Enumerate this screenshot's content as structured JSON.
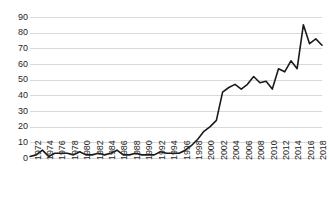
{
  "chart_data": {
    "type": "line",
    "title": "",
    "subtitle": "",
    "xlabel": "",
    "ylabel": "",
    "ylim": [
      0,
      90
    ],
    "ytick_step": 10,
    "yticks": [
      0,
      10,
      20,
      30,
      40,
      50,
      60,
      70,
      80,
      90
    ],
    "grid": "horizontal",
    "legend": "none",
    "line_color": "#1a1a1a",
    "gridline_color": "#d9d9d9",
    "tick_label_color": "#262626",
    "xtick_labels": [
      "1972",
      "1974",
      "1976",
      "1978",
      "1980",
      "1982",
      "1984",
      "1986",
      "1988",
      "1990",
      "1992",
      "1994",
      "1996",
      "1998",
      "2000",
      "2002",
      "2004",
      "2006",
      "2008",
      "2010",
      "2012",
      "2014",
      "2016",
      "2018"
    ],
    "xlim": [
      1972,
      2019
    ],
    "x": [
      1972,
      1973,
      1974,
      1975,
      1976,
      1977,
      1978,
      1979,
      1980,
      1981,
      1982,
      1983,
      1984,
      1985,
      1986,
      1987,
      1988,
      1989,
      1990,
      1991,
      1992,
      1993,
      1994,
      1995,
      1996,
      1997,
      1998,
      1999,
      2000,
      2001,
      2002,
      2003,
      2004,
      2005,
      2006,
      2007,
      2008,
      2009,
      2010,
      2011,
      2012,
      2013,
      2014,
      2015,
      2016,
      2017,
      2018,
      2019
    ],
    "series": [
      {
        "name": "value",
        "values": [
          1,
          2,
          5,
          1,
          3,
          3,
          3,
          2,
          4,
          2,
          2,
          3,
          2,
          3,
          5,
          2,
          2,
          3,
          2,
          2,
          2,
          4,
          3,
          3,
          3,
          5,
          8,
          12,
          17,
          20,
          24,
          42,
          45,
          47,
          44,
          47,
          52,
          48,
          49,
          44,
          57,
          55,
          62,
          57,
          85,
          73,
          76,
          72
        ]
      }
    ]
  }
}
